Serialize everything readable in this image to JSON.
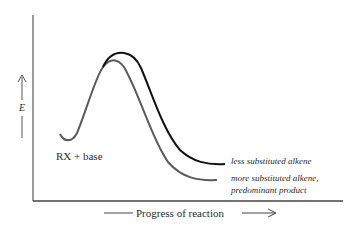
{
  "diagram": {
    "type": "reaction-energy-profile",
    "y_axis": {
      "label": "E",
      "arrow": "up"
    },
    "x_axis": {
      "label": "Progress of reaction",
      "arrow": "right"
    },
    "start_label": "RX + base",
    "curves": [
      {
        "name": "less substituted alkene",
        "label": "less substituted alkene",
        "color": "#111111",
        "relative_activation_energy": "higher",
        "relative_product_energy": "higher"
      },
      {
        "name": "more substituted alkene",
        "label_line1": "more substituted alkene,",
        "label_line2": "predominant product",
        "color": "#555555",
        "relative_activation_energy": "lower",
        "relative_product_energy": "lower"
      }
    ],
    "colors": {
      "axis": "#555555",
      "text": "#2a2a2a",
      "label_italic": "#3a3a3a"
    }
  }
}
